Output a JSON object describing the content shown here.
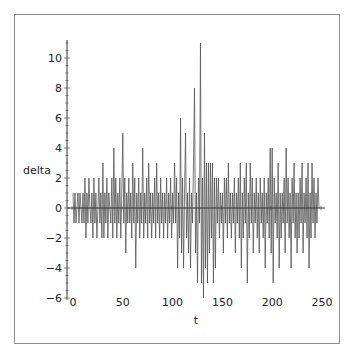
{
  "chart_data": {
    "type": "line",
    "title": "",
    "xlabel": "t",
    "ylabel": "delta",
    "xlim": [
      0,
      250
    ],
    "ylim": [
      -6,
      11
    ],
    "x_ticks": [
      0,
      50,
      100,
      150,
      200,
      250
    ],
    "x_tick_labels": [
      "0",
      "50",
      "100",
      "150",
      "200",
      "250"
    ],
    "y_ticks": [
      -6,
      -4,
      -2,
      0,
      2,
      4,
      6,
      8,
      10
    ],
    "y_tick_labels": [
      "−6",
      "−4",
      "−2",
      "0",
      "2",
      "4",
      "6",
      "8",
      "10"
    ],
    "grid": false,
    "legend": null,
    "line_color": "#555555",
    "axis_color": "#333333",
    "series": [
      {
        "name": "delta",
        "x_start": 1,
        "x_step": 1,
        "values": [
          1,
          -1,
          1,
          -1,
          0,
          1,
          -1,
          1,
          0,
          -1,
          1,
          -1,
          2,
          -2,
          1,
          -1,
          2,
          0,
          -1,
          1,
          -2,
          2,
          -1,
          1,
          -2,
          0,
          2,
          -1,
          1,
          -2,
          3,
          -2,
          1,
          -1,
          2,
          -2,
          1,
          0,
          -1,
          2,
          -2,
          4,
          -1,
          2,
          -2,
          1,
          -1,
          2,
          -2,
          1,
          5,
          -1,
          2,
          -3,
          1,
          -1,
          2,
          -1,
          1,
          -2,
          3,
          -1,
          2,
          -4,
          1,
          -1,
          2,
          -2,
          1,
          -1,
          4,
          -2,
          1,
          -1,
          2,
          -2,
          3,
          -1,
          1,
          -2,
          1,
          -1,
          2,
          -2,
          3,
          -1,
          1,
          -2,
          2,
          -1,
          1,
          -2,
          1,
          -1,
          2,
          -2,
          1,
          -1,
          2,
          -2,
          1,
          -1,
          3,
          -1,
          2,
          -4,
          1,
          -2,
          6,
          -3,
          2,
          -4,
          1,
          5,
          -2,
          1,
          -3,
          2,
          -4,
          1,
          -1,
          3,
          8,
          -3,
          1,
          -5,
          2,
          -1,
          11,
          -5,
          2,
          -6,
          5,
          -4,
          3,
          -5,
          3,
          -3,
          3,
          -2,
          3,
          -5,
          2,
          -4,
          2,
          -1,
          2,
          -2,
          1,
          -1,
          1,
          -3,
          2,
          -1,
          2,
          -2,
          3,
          -1,
          1,
          -2,
          1,
          -1,
          2,
          -3,
          1,
          -1,
          2,
          -2,
          3,
          -4,
          1,
          -2,
          2,
          -1,
          3,
          -5,
          1,
          -2,
          3,
          -1,
          2,
          -3,
          1,
          -1,
          2,
          -2,
          1,
          -3,
          2,
          -1,
          1,
          -2,
          2,
          -4,
          1,
          -1,
          2,
          -2,
          4,
          -3,
          4,
          -5,
          2,
          -1,
          1,
          -2,
          3,
          -4,
          1,
          -2,
          1,
          -1,
          2,
          -3,
          4,
          -1,
          2,
          -2,
          1,
          -4,
          2,
          -1,
          3,
          -2,
          1,
          -3,
          1,
          -2,
          2,
          -1,
          3,
          -3,
          1,
          -1,
          2,
          -2,
          3,
          -4,
          1,
          -2,
          3,
          -1,
          2,
          -2,
          1,
          -1,
          2,
          0
        ]
      }
    ],
    "annotations": {
      "max_peak": {
        "t": 130,
        "value": 11
      },
      "min_trough": {
        "t": 133,
        "value": -6
      }
    }
  }
}
